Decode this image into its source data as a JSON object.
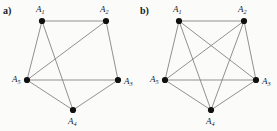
{
  "figure": {
    "width": 277,
    "height": 131,
    "background_color": "#fbfbfa",
    "edge_color": "#7d7d7d",
    "vertex_color": "#101010",
    "label_color": "#1a1a1a"
  },
  "panels": [
    {
      "id": "a",
      "label": "a)",
      "graph_name": "graph-a",
      "description": "pentagon with two crossing chords",
      "vertices": [
        {
          "id": "A1",
          "label_base": "A",
          "label_sub": "1",
          "x": 42,
          "y": 21,
          "label_x": 36,
          "label_y": 10,
          "r": 3.1
        },
        {
          "id": "A2",
          "label_base": "A",
          "label_sub": "2",
          "x": 106,
          "y": 21,
          "label_x": 100,
          "label_y": 10,
          "r": 3.1
        },
        {
          "id": "A3",
          "label_base": "A",
          "label_sub": "3",
          "x": 118,
          "y": 80,
          "label_x": 124,
          "label_y": 82,
          "r": 3.1
        },
        {
          "id": "A4",
          "label_base": "A",
          "label_sub": "4",
          "x": 73,
          "y": 110,
          "label_x": 68,
          "label_y": 122,
          "r": 3.1
        },
        {
          "id": "A5",
          "label_base": "A",
          "label_sub": "5",
          "x": 27,
          "y": 80,
          "label_x": 12,
          "label_y": 80,
          "r": 3.1
        }
      ],
      "edges": [
        {
          "from": "A1",
          "to": "A2"
        },
        {
          "from": "A1",
          "to": "A5"
        },
        {
          "from": "A1",
          "to": "A4"
        },
        {
          "from": "A2",
          "to": "A3"
        },
        {
          "from": "A2",
          "to": "A5"
        },
        {
          "from": "A3",
          "to": "A4"
        },
        {
          "from": "A3",
          "to": "A5"
        },
        {
          "from": "A4",
          "to": "A5"
        }
      ],
      "edge_count": 8,
      "missing_edges": [
        {
          "from": "A1",
          "to": "A3"
        },
        {
          "from": "A2",
          "to": "A4"
        }
      ]
    },
    {
      "id": "b",
      "label": "b)",
      "graph_name": "graph-b",
      "description": "complete graph on five vertices",
      "vertices": [
        {
          "id": "A1",
          "label_base": "A",
          "label_sub": "1",
          "x": 41,
          "y": 21,
          "label_x": 35,
          "label_y": 10,
          "r": 3.1
        },
        {
          "id": "A2",
          "label_base": "A",
          "label_sub": "2",
          "x": 106,
          "y": 21,
          "label_x": 100,
          "label_y": 10,
          "r": 3.1
        },
        {
          "id": "A3",
          "label_base": "A",
          "label_sub": "3",
          "x": 118,
          "y": 80,
          "label_x": 124,
          "label_y": 82,
          "r": 3.1
        },
        {
          "id": "A4",
          "label_base": "A",
          "label_sub": "4",
          "x": 73,
          "y": 110,
          "label_x": 68,
          "label_y": 122,
          "r": 3.1
        },
        {
          "id": "A5",
          "label_base": "A",
          "label_sub": "5",
          "x": 27,
          "y": 80,
          "label_x": 12,
          "label_y": 80,
          "r": 3.1
        }
      ],
      "edges": [
        {
          "from": "A1",
          "to": "A2"
        },
        {
          "from": "A1",
          "to": "A3"
        },
        {
          "from": "A1",
          "to": "A4"
        },
        {
          "from": "A1",
          "to": "A5"
        },
        {
          "from": "A2",
          "to": "A3"
        },
        {
          "from": "A2",
          "to": "A4"
        },
        {
          "from": "A2",
          "to": "A5"
        },
        {
          "from": "A3",
          "to": "A4"
        },
        {
          "from": "A3",
          "to": "A5"
        },
        {
          "from": "A4",
          "to": "A5"
        }
      ],
      "edge_count": 10,
      "missing_edges": []
    }
  ]
}
